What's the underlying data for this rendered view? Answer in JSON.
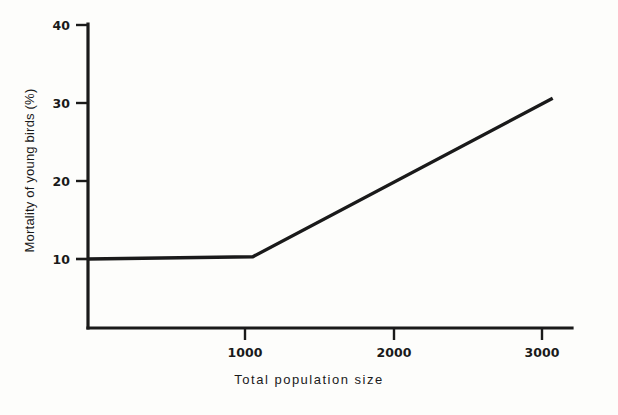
{
  "chart_data": {
    "type": "line",
    "title": "",
    "xlabel": "Total population size",
    "ylabel": "Mortality of young birds (%)",
    "xlim": [
      0,
      3200
    ],
    "ylim": [
      0,
      40
    ],
    "grid": false,
    "legend": "none",
    "xticks": [
      {
        "value": 1000,
        "label": "1000"
      },
      {
        "value": 2000,
        "label": "2000"
      },
      {
        "value": 3000,
        "label": "3000"
      }
    ],
    "yticks": [
      {
        "value": 10,
        "label": "10"
      },
      {
        "value": 20,
        "label": "20"
      },
      {
        "value": 30,
        "label": "30"
      },
      {
        "value": 40,
        "label": "40"
      }
    ],
    "series": [
      {
        "name": "Mortality of young birds",
        "color": "#1a1a1a",
        "x": [
          0,
          1050,
          2960
        ],
        "y": [
          10,
          10.3,
          30.6
        ],
        "points": [
          {
            "x": 0,
            "y": 10
          },
          {
            "x": 1050,
            "y": 10.3
          },
          {
            "x": 2960,
            "y": 30.6
          }
        ]
      }
    ],
    "annotations": []
  },
  "axes": {
    "x_axis_name": "x-axis",
    "y_axis_name": "y-axis"
  }
}
